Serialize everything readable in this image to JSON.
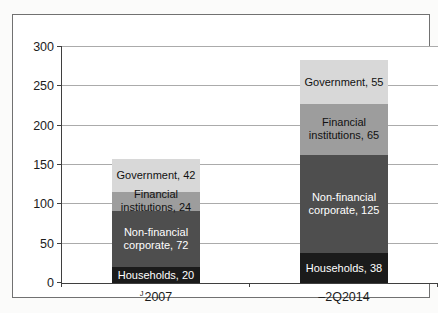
{
  "chart_data": {
    "type": "bar",
    "subtype": "stacked",
    "title": "",
    "xlabel": "",
    "ylabel": "",
    "categories": [
      "2007",
      "2Q2014"
    ],
    "x_ticks": [
      {
        "prefix": "J",
        "prefix_superscript": true,
        "label": "2007"
      },
      {
        "prefix": "–",
        "prefix_superscript": false,
        "label": "2Q2014"
      }
    ],
    "series": [
      {
        "name": "Households",
        "values": [
          20,
          38
        ],
        "color": "#1b1b1b",
        "label_color": "#ffffff",
        "labels": [
          "Households, 20",
          "Households, 38"
        ]
      },
      {
        "name": "Non-financial corporate",
        "values": [
          72,
          125
        ],
        "color": "#4e4e4e",
        "label_color": "#ffffff",
        "labels": [
          "Non-financial corporate, 72",
          "Non-financial corporate, 125"
        ]
      },
      {
        "name": "Financial institutions",
        "values": [
          24,
          65
        ],
        "color": "#9d9d9d",
        "label_color": "#111111",
        "labels": [
          "Financial institutions, 24",
          "Financial institutions, 65"
        ]
      },
      {
        "name": "Government",
        "values": [
          42,
          55
        ],
        "color": "#d8d8d8",
        "label_color": "#111111",
        "labels": [
          "Government, 42",
          "Government, 55"
        ]
      }
    ],
    "totals": [
      158,
      283
    ],
    "ylim": [
      0,
      300
    ],
    "yticks": [
      0,
      50,
      100,
      150,
      200,
      250,
      300
    ],
    "grid": true,
    "legend": "none",
    "bar_centers_fraction": [
      0.25,
      0.75
    ]
  },
  "style": {
    "page_background": "#fbfbfa",
    "plot_background": "#ffffff",
    "frame_border_color": "#717171",
    "axis_color": "#3f3f3f",
    "gridline_color": "#ababab",
    "tick_label_color": "#1c1c1c"
  }
}
